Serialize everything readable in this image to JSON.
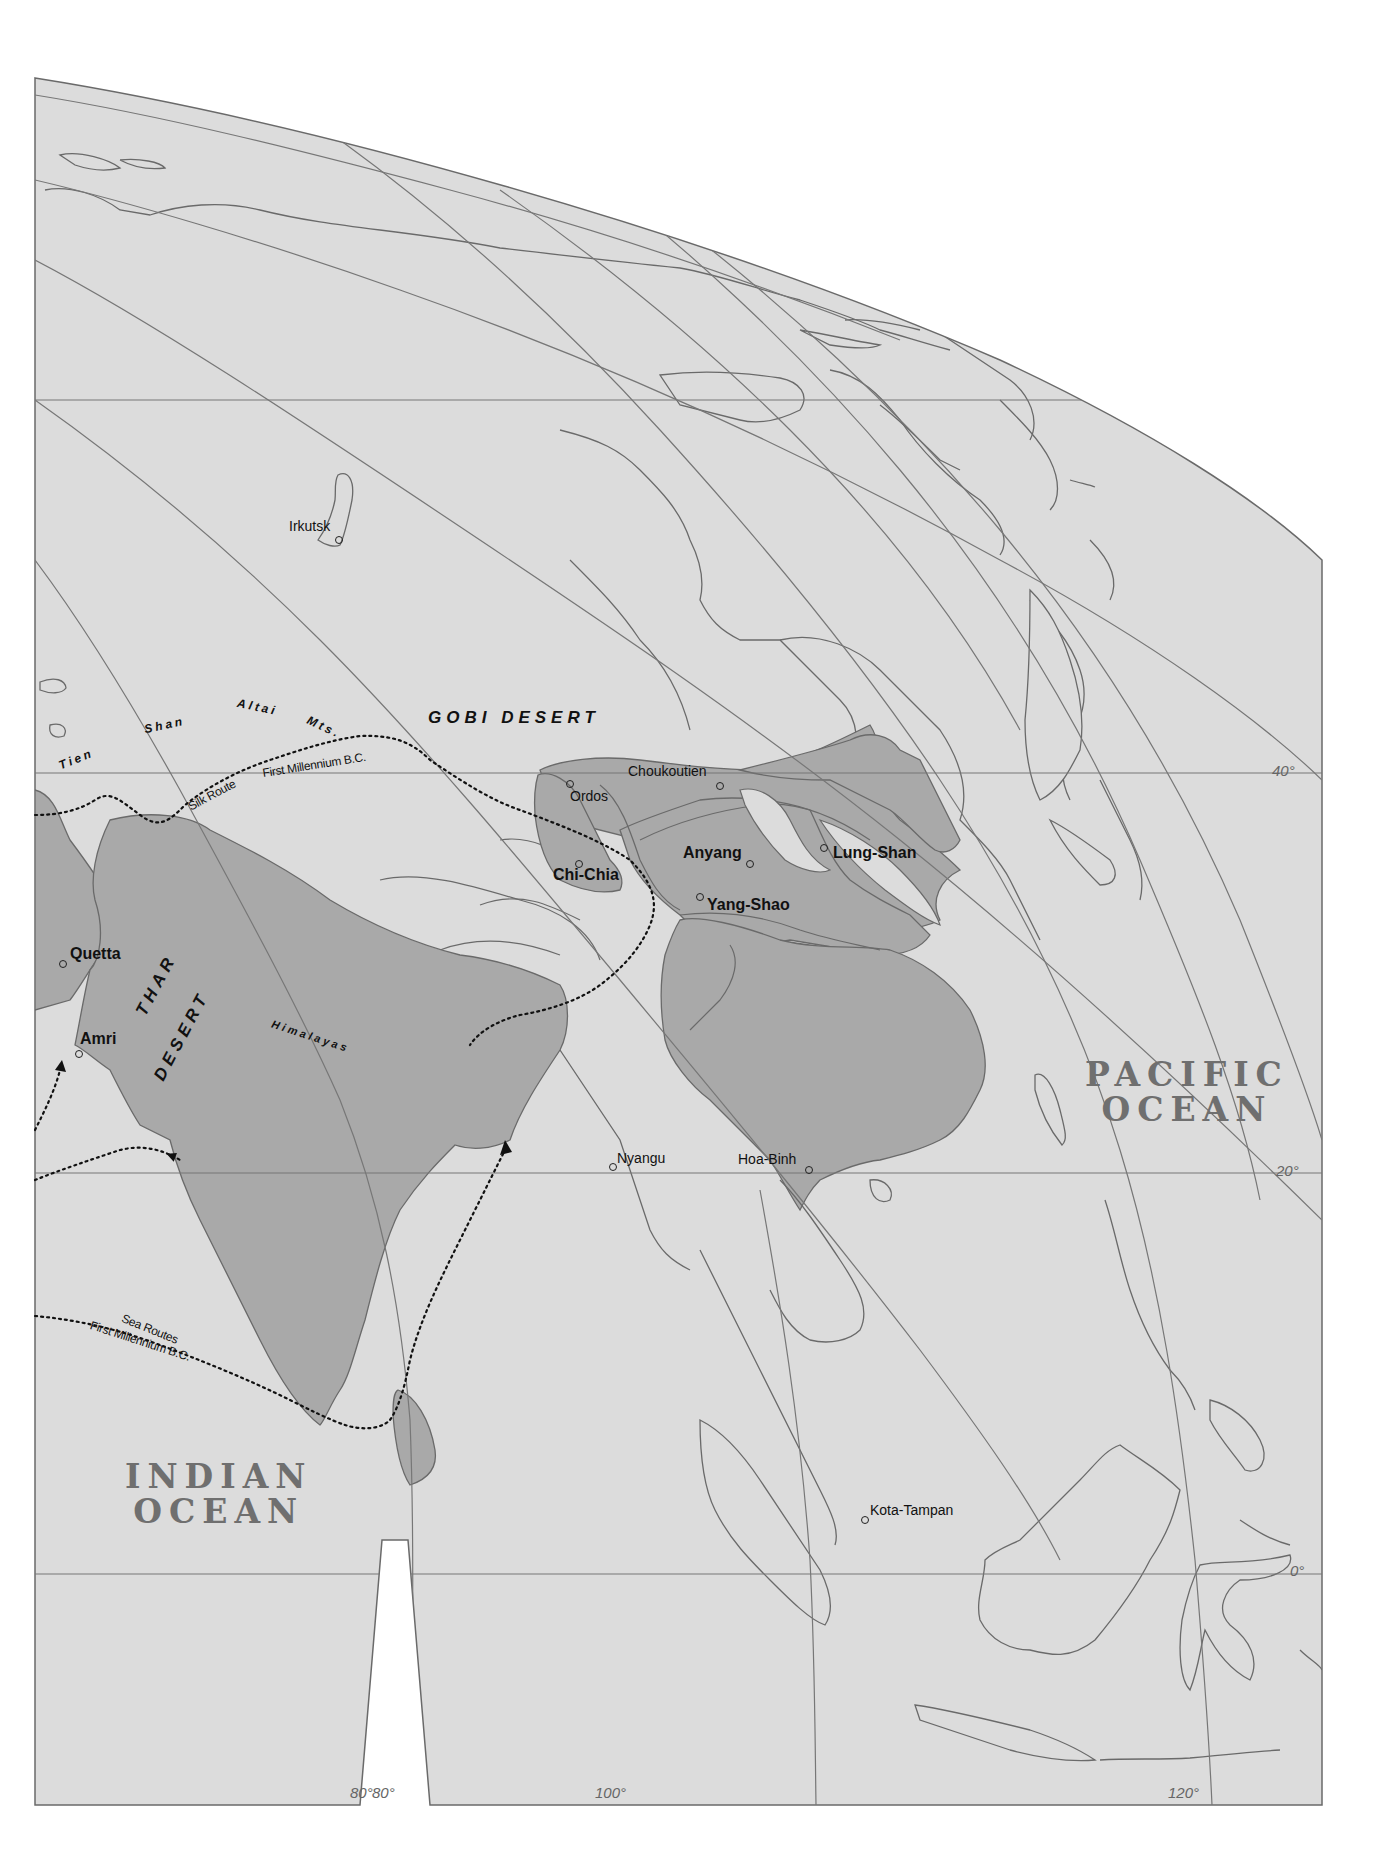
{
  "colors": {
    "background": "#ffffff",
    "sea": "#dcdcdc",
    "land_unshaded": "#dcdcdc",
    "culture_region": "#a9a9a9",
    "coastline": "#6a6a6a",
    "graticule": "#777777",
    "label_text": "#111111",
    "ocean_label": "#6f6f6f",
    "route_line": "#111111"
  },
  "regions": {
    "gobi": "GOBI DESERT",
    "thar_line1": "THAR",
    "thar_line2": "DESERT"
  },
  "mountains": {
    "tien": "Tien",
    "shan": "Shan",
    "altai": "Altai",
    "mts": "Mts.",
    "himalayas": "Himalayas"
  },
  "routes": {
    "silk_route": "Silk Route",
    "silk_period": "First Millennium B.C.",
    "sea_routes": "Sea Routes",
    "sea_period": "First Millennium B.C."
  },
  "oceans": {
    "pacific_line1": "PACIFIC",
    "pacific_line2": "OCEAN",
    "indian_line1": "INDIAN",
    "indian_line2": "OCEAN"
  },
  "sites": [
    {
      "name": "Irkutsk",
      "major": false
    },
    {
      "name": "Ordos",
      "major": false
    },
    {
      "name": "Choukoutien",
      "major": false
    },
    {
      "name": "Anyang",
      "major": true
    },
    {
      "name": "Lung-Shan",
      "major": true
    },
    {
      "name": "Chi-Chia",
      "major": true
    },
    {
      "name": "Yang-Shao",
      "major": true
    },
    {
      "name": "Quetta",
      "major": true
    },
    {
      "name": "Amri",
      "major": true
    },
    {
      "name": "Nyangu",
      "major": false
    },
    {
      "name": "Hoa-Binh",
      "major": false
    },
    {
      "name": "Kota-Tampan",
      "major": false
    }
  ],
  "graticule": {
    "latitudes": [
      "40°",
      "20°",
      "0°"
    ],
    "longitudes": [
      "80°",
      "80°",
      "100°",
      "120°"
    ]
  }
}
